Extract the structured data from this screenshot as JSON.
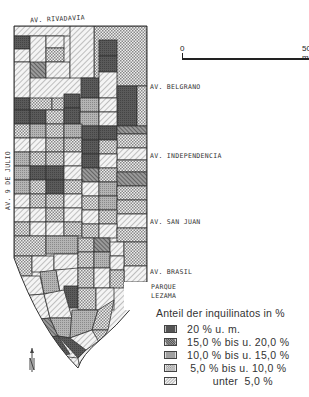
{
  "map": {
    "streets": {
      "top": "AV. RIVADAVIA",
      "left": "AV. 9 DE JULIO",
      "belgrano": "AV. BELGRANO",
      "independencia": "AV. INDEPENDENCIA",
      "san_juan": "AV. SAN JUAN",
      "brasil": "AV. BRASIL"
    },
    "park_label_1": "PARQUE",
    "park_label_2": "LEZAMA",
    "north_symbol": "N"
  },
  "scale_bar": {
    "start": "0",
    "end": "500 m"
  },
  "legend": {
    "title": "Anteil der inquilinatos in %",
    "items": [
      {
        "label": "20 % u. m.",
        "pattern": "dark-solid",
        "color": "#555555"
      },
      {
        "label": "15,0 % bis u. 20,0 %",
        "pattern": "dense-diagonal",
        "color": "#6e6e6e"
      },
      {
        "label": "10,0 % bis u. 15,0 %",
        "pattern": "fine-dots",
        "color": "#a5a5a5"
      },
      {
        "label": " 5,0 % bis u. 10,0 %",
        "pattern": "checker",
        "color": "#c8c8c8"
      },
      {
        "label": "        unter  5,0 %",
        "pattern": "light-diagonal",
        "color": "#e6e6e6"
      }
    ]
  }
}
